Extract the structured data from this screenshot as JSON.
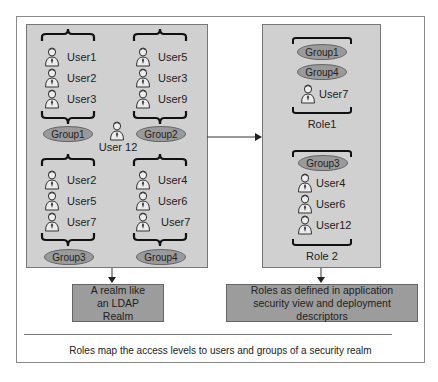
{
  "realm": {
    "groups": [
      {
        "name": "Group1",
        "users": [
          "User1",
          "User2",
          "User3"
        ]
      },
      {
        "name": "Group2",
        "users": [
          "User5",
          "User3",
          "User9"
        ]
      },
      {
        "name": "Group3",
        "users": [
          "User2",
          "User5",
          "User7"
        ]
      },
      {
        "name": "Group4",
        "users": [
          "User4",
          "User6",
          "User7"
        ]
      }
    ],
    "standalone_user": "User 12",
    "label": "A realm like an LDAP Realm"
  },
  "roles": {
    "role1": {
      "name": "Role1",
      "groups": [
        "Group1",
        "Group4"
      ],
      "users": [
        "User7"
      ]
    },
    "role2": {
      "name": "Role 2",
      "groups": [
        "Group3"
      ],
      "users": [
        "User4",
        "User6",
        "User12"
      ]
    },
    "label": "Roles as defined in application security view and deployment descriptors"
  },
  "caption": "Roles map the access levels to users and groups of a security realm",
  "colors": {
    "panel": "#d0d0d0",
    "group_ellipse": "#9a9a9a",
    "label_box": "#9c9c9c"
  }
}
